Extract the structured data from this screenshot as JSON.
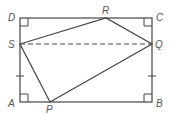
{
  "diagram": {
    "type": "geometry",
    "stroke_color": "#444444",
    "points": {
      "A": {
        "label": "A",
        "x": 20,
        "y": 102
      },
      "B": {
        "label": "B",
        "x": 152,
        "y": 102
      },
      "C": {
        "label": "C",
        "x": 152,
        "y": 18
      },
      "D": {
        "label": "D",
        "x": 20,
        "y": 18
      },
      "P": {
        "label": "P",
        "x": 50,
        "y": 102
      },
      "Q": {
        "label": "Q",
        "x": 152,
        "y": 44
      },
      "R": {
        "label": "R",
        "x": 106,
        "y": 18
      },
      "S": {
        "label": "S",
        "x": 20,
        "y": 44
      }
    },
    "segments": [
      {
        "from": "A",
        "to": "B",
        "style": "solid"
      },
      {
        "from": "B",
        "to": "C",
        "style": "solid"
      },
      {
        "from": "C",
        "to": "D",
        "style": "solid"
      },
      {
        "from": "D",
        "to": "A",
        "style": "solid"
      },
      {
        "from": "P",
        "to": "Q",
        "style": "solid"
      },
      {
        "from": "Q",
        "to": "R",
        "style": "solid"
      },
      {
        "from": "R",
        "to": "S",
        "style": "solid"
      },
      {
        "from": "S",
        "to": "P",
        "style": "solid"
      },
      {
        "from": "S",
        "to": "Q",
        "style": "dashed"
      }
    ],
    "right_angle_marks": [
      "A",
      "B",
      "C",
      "D"
    ],
    "tick_marks": [
      {
        "segment": "SA",
        "count": 1
      },
      {
        "segment": "QB",
        "count": 1
      }
    ]
  }
}
